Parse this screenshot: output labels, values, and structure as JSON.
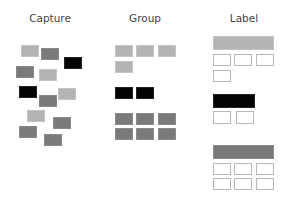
{
  "titles": {
    "capture": "Capture",
    "group": "Group",
    "label": "Label"
  },
  "colors": {
    "light": "#b4b4b4",
    "medium": "#7a7a7a",
    "black": "#050505",
    "box_border": "#b8b8b8"
  },
  "capture_cards": [
    {
      "shade": "light",
      "x": 21,
      "y": 45
    },
    {
      "shade": "medium",
      "x": 41,
      "y": 48
    },
    {
      "shade": "black",
      "x": 64,
      "y": 57
    },
    {
      "shade": "medium",
      "x": 16,
      "y": 66
    },
    {
      "shade": "light",
      "x": 39,
      "y": 69
    },
    {
      "shade": "black",
      "x": 19,
      "y": 86
    },
    {
      "shade": "light",
      "x": 58,
      "y": 88
    },
    {
      "shade": "medium",
      "x": 39,
      "y": 95
    },
    {
      "shade": "light",
      "x": 27,
      "y": 110
    },
    {
      "shade": "medium",
      "x": 53,
      "y": 117
    },
    {
      "shade": "medium",
      "x": 19,
      "y": 126
    },
    {
      "shade": "medium",
      "x": 44,
      "y": 134
    }
  ],
  "groups": [
    {
      "shade": "light",
      "count": 4
    },
    {
      "shade": "black",
      "count": 2
    },
    {
      "shade": "medium",
      "count": 6
    }
  ],
  "labels": [
    {
      "shade": "light",
      "bar_width": 61,
      "box_count": 4
    },
    {
      "shade": "black",
      "bar_width": 42,
      "box_count": 2
    },
    {
      "shade": "medium",
      "bar_width": 61,
      "box_count": 6
    }
  ]
}
